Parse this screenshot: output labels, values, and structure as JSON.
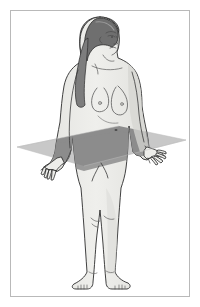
{
  "figure": {
    "title": "Transverse (horizontal) plane of the human body",
    "subject": "Anatomical female figure, anterior-oblique view, standing",
    "caption": "",
    "plane_name": "Transverse plane",
    "view": "anterior oblique",
    "width": 200,
    "height": 307
  },
  "frame": {
    "border_color": "#b9b9b9",
    "background": "#ffffff",
    "inset_left": 10,
    "inset_top": 10,
    "width": 180,
    "height": 287
  },
  "palette": {
    "background": "#ffffff",
    "frame_border": "#b9b9b9",
    "outline": "#2b2b2b",
    "skin_fill": "#ededea",
    "skin_shade": "#dcdcd8",
    "skin_shade_deep": "#cfcfca",
    "hair_fill": "#8f8f8f",
    "hair_shade": "#6f6f6f",
    "hair_highlight": "#a8a8a8",
    "plane_fill": "#c8c8c8",
    "plane_edge": "#bcbcbc",
    "plane_band_on_body": "#8c8c8c",
    "detail_line": "#6a6a6a"
  },
  "plane": {
    "label": "transverse-plane",
    "shape": "parallelogram",
    "fill": "#c8c8c8",
    "opacity": 0.95,
    "vertices": [
      {
        "x": 17,
        "y": 147
      },
      {
        "x": 119,
        "y": 126
      },
      {
        "x": 186,
        "y": 140
      },
      {
        "x": 84,
        "y": 166
      }
    ],
    "intersection_band": {
      "label": "plane-body-intersection",
      "fill": "#8c8c8c",
      "y_top": 133,
      "y_bottom": 162
    }
  },
  "body": {
    "label": "female-figure",
    "head_top_y": 17,
    "feet_bottom_y": 289,
    "center_x": 100,
    "parts": [
      {
        "name": "head",
        "label": "Head"
      },
      {
        "name": "hair",
        "label": "Hair"
      },
      {
        "name": "face",
        "label": "Face"
      },
      {
        "name": "neck",
        "label": "Neck"
      },
      {
        "name": "torso",
        "label": "Torso"
      },
      {
        "name": "left-arm",
        "label": "Left arm"
      },
      {
        "name": "right-arm",
        "label": "Right arm"
      },
      {
        "name": "left-hand",
        "label": "Left hand"
      },
      {
        "name": "right-hand",
        "label": "Right hand"
      },
      {
        "name": "hips",
        "label": "Hips"
      },
      {
        "name": "left-leg",
        "label": "Left leg"
      },
      {
        "name": "right-leg",
        "label": "Right leg"
      },
      {
        "name": "left-foot",
        "label": "Left foot"
      },
      {
        "name": "right-foot",
        "label": "Right foot"
      }
    ]
  }
}
